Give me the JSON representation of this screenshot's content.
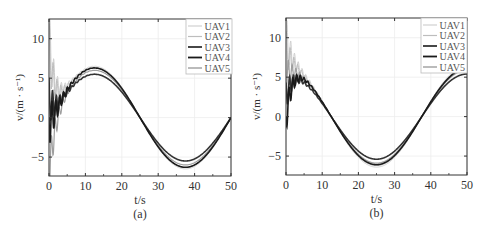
{
  "chart_data": [
    {
      "type": "line",
      "panel_label": "(a)",
      "xlabel": "t/s",
      "ylabel": "v/(m · s⁻¹)",
      "xlim": [
        0,
        50
      ],
      "ylim": [
        -7.4,
        12.5
      ],
      "xticks": [
        0,
        10,
        20,
        30,
        40,
        50
      ],
      "yticks": [
        -5,
        0,
        5,
        10
      ],
      "grid": true,
      "legend_position": "upper right",
      "legend": [
        "UAV1",
        "UAV2",
        "UAV3",
        "UAV4",
        "UAV5"
      ],
      "description": "Sinusoidal velocity tracking, period 50 s, peak near t=12.5 s, trough near t=37.5 s, with oscillatory transient for t<5 s",
      "series": [
        {
          "name": "UAV1",
          "color": "#d0d0d0",
          "width": 1.0,
          "amplitude": 6.5,
          "phase": "sin",
          "transient": {
            "start": 10.5,
            "osc": 4.0
          }
        },
        {
          "name": "UAV2",
          "color": "#bdbdbd",
          "width": 1.0,
          "amplitude": 6.3,
          "phase": "sin",
          "transient": {
            "start": 9.0,
            "osc": 3.5
          }
        },
        {
          "name": "UAV3",
          "color": "#333333",
          "width": 1.6,
          "amplitude": 5.5,
          "phase": "sin",
          "transient": {
            "start": 2.5,
            "osc": 2.8
          }
        },
        {
          "name": "UAV4",
          "color": "#1a1a1a",
          "width": 1.6,
          "amplitude": 6.3,
          "phase": "sin",
          "transient": {
            "start": -0.5,
            "osc": 3.2
          }
        },
        {
          "name": "UAV5",
          "color": "#9e9e9e",
          "width": 1.2,
          "amplitude": 6.0,
          "phase": "sin",
          "transient": {
            "start": -7.0,
            "osc": 3.0
          }
        }
      ],
      "key_points": {
        "peak_t": 12.5,
        "peak_v_upper": 6.4,
        "peak_v_lower": 5.5,
        "trough_t": 37.5,
        "trough_v_upper": -5.3,
        "trough_v_lower": -6.0,
        "zero_cross_t": 25
      }
    },
    {
      "type": "line",
      "panel_label": "(b)",
      "xlabel": "t/s",
      "ylabel": "v/(m · s⁻¹)",
      "xlim": [
        0,
        50
      ],
      "ylim": [
        -7.4,
        12.5
      ],
      "xticks": [
        0,
        10,
        20,
        30,
        40,
        50
      ],
      "yticks": [
        -5,
        0,
        5,
        10
      ],
      "grid": true,
      "legend_position": "upper right",
      "legend": [
        "UAV1",
        "UAV2",
        "UAV3",
        "UAV4",
        "UAV5"
      ],
      "description": "Cosine-like velocity tracking, period 50 s, trough near t=25 s, zero crossings near t=12.5 s and t=37.5 s, with oscillatory transient for t<7 s",
      "series": [
        {
          "name": "UAV1",
          "color": "#d0d0d0",
          "width": 1.0,
          "amplitude": 6.4,
          "phase": "cos",
          "transient": {
            "start": 10.0,
            "osc": 3.0
          }
        },
        {
          "name": "UAV2",
          "color": "#bdbdbd",
          "width": 1.0,
          "amplitude": 6.2,
          "phase": "cos",
          "transient": {
            "start": 8.5,
            "osc": 2.5
          }
        },
        {
          "name": "UAV3",
          "color": "#333333",
          "width": 1.6,
          "amplitude": 5.4,
          "phase": "cos",
          "transient": {
            "start": 2.5,
            "osc": 2.0
          }
        },
        {
          "name": "UAV4",
          "color": "#1a1a1a",
          "width": 1.6,
          "amplitude": 6.1,
          "phase": "cos",
          "transient": {
            "start": -0.3,
            "osc": 2.2
          }
        },
        {
          "name": "UAV5",
          "color": "#9e9e9e",
          "width": 1.2,
          "amplitude": 5.9,
          "phase": "cos",
          "transient": {
            "start": 5.5,
            "osc": 2.0
          }
        }
      ],
      "key_points": {
        "trough_t": 25,
        "trough_v_upper": -5.3,
        "trough_v_lower": -6.2,
        "zero_cross_t": [
          12.5,
          37.5
        ],
        "end_v_upper": 6.0,
        "end_v_lower": 5.4
      }
    }
  ],
  "panels": [
    {
      "left": 0,
      "plot": {
        "x0": 49,
        "x1": 231,
        "y0": 19,
        "y1": 176
      },
      "legend_box": {
        "x": 186,
        "y": 19,
        "w": 46,
        "h": 55
      }
    },
    {
      "left": 0,
      "plot": {
        "x0": 286,
        "x1": 467,
        "y0": 18,
        "y1": 175
      },
      "legend_box": {
        "x": 421,
        "y": 18,
        "w": 46,
        "h": 55
      }
    }
  ]
}
